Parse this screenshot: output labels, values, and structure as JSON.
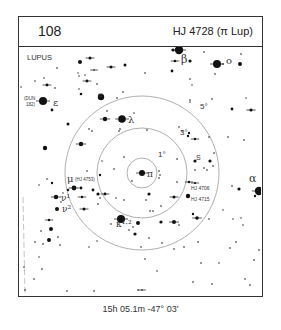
{
  "header": {
    "chart_number": "108",
    "title": "HJ 4728 (π Lup)"
  },
  "map": {
    "constellation": "LUPUS",
    "target_label": "π",
    "rings": [
      {
        "label": "1°",
        "degrees": 1
      },
      {
        "label": "3°",
        "degrees": 3
      },
      {
        "label": "5°",
        "degrees": 5
      }
    ],
    "star_labels": [
      {
        "id": "beta",
        "text": "β",
        "kind": "greek"
      },
      {
        "id": "omicron",
        "text": "o",
        "kind": "greek"
      },
      {
        "id": "epsilon",
        "text": "ε",
        "kind": "greek"
      },
      {
        "id": "epsilon-catalog-1",
        "text": "(DUN",
        "kind": "small"
      },
      {
        "id": "epsilon-catalog-2",
        "text": "182)",
        "kind": "small"
      },
      {
        "id": "e",
        "text": "e",
        "kind": "greek"
      },
      {
        "id": "lambda",
        "text": "λ",
        "kind": "greek"
      },
      {
        "id": "s",
        "text": "S",
        "kind": "small"
      },
      {
        "id": "hj4706",
        "text": "HJ 4706",
        "kind": "small"
      },
      {
        "id": "hj4715",
        "text": "HJ 4715",
        "kind": "small"
      },
      {
        "id": "alpha",
        "text": "α",
        "kind": "greek"
      },
      {
        "id": "mu",
        "text": "μ",
        "kind": "greek"
      },
      {
        "id": "mu-catalog",
        "text": "(HJ 4753)",
        "kind": "small"
      },
      {
        "id": "nu1",
        "text": "ν¹",
        "kind": "greek"
      },
      {
        "id": "nu2",
        "text": "ν²",
        "kind": "greek"
      },
      {
        "id": "kappa",
        "text": "κ¹·²",
        "kind": "greek"
      }
    ]
  },
  "footer": {
    "coordinates": "15h 05.1m  -47° 03'"
  }
}
